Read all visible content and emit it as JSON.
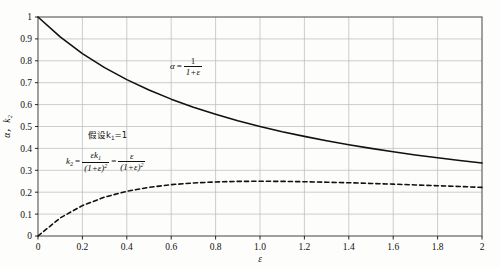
{
  "figure": {
    "background_color": "#fdfdfb",
    "ink_color": "#111111",
    "grid_color": "#b9b9b9",
    "frame_color": "#555555"
  },
  "annotations": {
    "alpha_formula": {
      "name": "alpha-formula",
      "lhs": "α",
      "equals": "=",
      "numerator": "1",
      "denominator": "1+ε"
    },
    "assumption": {
      "name": "assumption-note",
      "text": "假设k",
      "subscript": "1",
      "tail": "=1"
    },
    "k2_formula": {
      "name": "k2-formula",
      "lhs": "k",
      "lhs_sub": "2",
      "equals1": "=",
      "num1": "εk",
      "num1_sub": "1",
      "den1": "(1+ε)",
      "den1_sup": "2",
      "equals2": "=",
      "num2": "ε",
      "den2": "(1+ε)",
      "den2_sup": "2"
    }
  },
  "bleed_text": "",
  "chart_data": {
    "type": "line",
    "title": "",
    "xlabel": "ε",
    "ylabel": "α，k₂",
    "xlim": [
      0,
      2
    ],
    "ylim": [
      0,
      1
    ],
    "xticks": [
      0,
      0.2,
      0.4,
      0.6,
      0.8,
      1.0,
      1.2,
      1.4,
      1.6,
      1.8,
      2
    ],
    "xticklabels": [
      "0",
      "0.2",
      "0.4",
      "0.6",
      "0.8",
      "1.0",
      "1.2",
      "1.4",
      "1.6",
      "1.8",
      "2"
    ],
    "yticks": [
      0,
      0.1,
      0.2,
      0.3,
      0.4,
      0.5,
      0.6,
      0.7,
      0.8,
      0.9,
      1.0
    ],
    "yticklabels": [
      "0",
      "0.1",
      "0.2",
      "0.3",
      "0.4",
      "0.5",
      "0.6",
      "0.7",
      "0.8",
      "0.9",
      "1"
    ],
    "grid": true,
    "legend": "none",
    "series": [
      {
        "name": "alpha",
        "label": "α = 1/(1+ε)",
        "style": "solid",
        "color": "#111111",
        "width": 1.6,
        "x": [
          0,
          0.1,
          0.2,
          0.3,
          0.4,
          0.5,
          0.6,
          0.7,
          0.8,
          0.9,
          1.0,
          1.1,
          1.2,
          1.3,
          1.4,
          1.5,
          1.6,
          1.7,
          1.8,
          1.9,
          2.0
        ],
        "values": [
          1.0,
          0.909,
          0.833,
          0.769,
          0.714,
          0.667,
          0.625,
          0.588,
          0.556,
          0.526,
          0.5,
          0.476,
          0.455,
          0.435,
          0.417,
          0.4,
          0.385,
          0.37,
          0.357,
          0.345,
          0.333
        ]
      },
      {
        "name": "k2",
        "label": "k₂ = ε/(1+ε)²",
        "style": "dashed",
        "color": "#111111",
        "width": 1.6,
        "x": [
          0,
          0.1,
          0.2,
          0.3,
          0.4,
          0.5,
          0.6,
          0.7,
          0.8,
          0.9,
          1.0,
          1.1,
          1.2,
          1.3,
          1.4,
          1.5,
          1.6,
          1.7,
          1.8,
          1.9,
          2.0
        ],
        "values": [
          0,
          0.0826,
          0.1389,
          0.1775,
          0.2041,
          0.2222,
          0.2344,
          0.2422,
          0.2469,
          0.2493,
          0.25,
          0.2494,
          0.2479,
          0.2457,
          0.2431,
          0.24,
          0.2367,
          0.2332,
          0.2296,
          0.2259,
          0.2222
        ]
      }
    ]
  }
}
